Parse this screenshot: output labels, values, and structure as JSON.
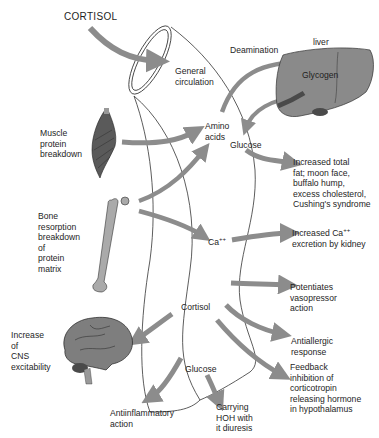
{
  "title": "CORTISOL",
  "colors": {
    "arrow": "#8c8c8c",
    "organ_fill": "#8a8a8a",
    "organ_dark": "#4a4a4a",
    "outline": "#333333",
    "text": "#1e1e1e",
    "background": "#ffffff"
  },
  "labels": {
    "general_circulation": "General\ncirculation",
    "deamination": "Deamination",
    "liver": "liver",
    "glycogen": "Glycogen",
    "muscle": "Muscle\nprotein\nbreakdown",
    "amino_acids": "Amino\nacids",
    "glucose_top": "Glucose",
    "increased_fat": "Increased total\nfat; moon face,\nbuffalo hump,\nexcess cholesterol,\nCushing's syndrome",
    "bone": "Bone\nresorption\nbreakdown\nof\nprotein\nmatrix",
    "ca": "Ca",
    "ca_sup": "++",
    "increased_ca_line1": "Increased Ca",
    "increased_ca_sup": "++",
    "increased_ca_line2": "excretion by kidney",
    "potentiates": "Potentiates\nvasopressor\naction",
    "cortisol_center": "Cortisol",
    "antiallergic": "Antiallergic\nresponse",
    "cns": "Increase\nof\nCNS\nexcitability",
    "feedback": "Feedback\ninhibition of\ncorticotropin\nreleasing hormone\nin hypothalamus",
    "glucose_bottom": "Glucose",
    "antiinflammatory": "Antiinflammatory\naction",
    "carrying": "Carrying\nHOH with\nit diuresis"
  },
  "icons": {
    "muscle": "muscle-icon",
    "bone": "femur-bone-icon",
    "brain": "brain-icon",
    "liver": "liver-icon",
    "vessel": "blood-vessel-icon"
  }
}
